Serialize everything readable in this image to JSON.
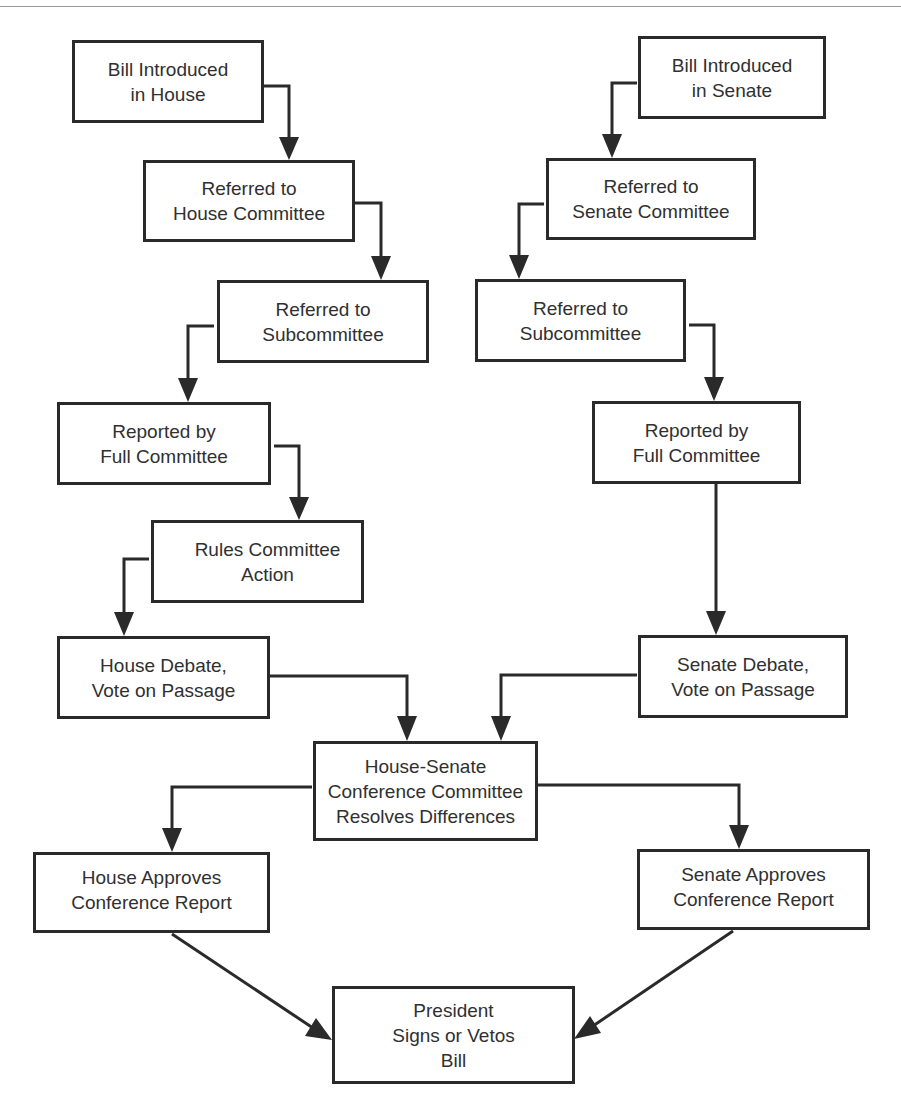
{
  "diagram": {
    "type": "flowchart",
    "colors": {
      "line": "#2a2a2a",
      "text": "#303030",
      "background": "#ffffff",
      "rule": "#9a9a9a"
    },
    "nodes": {
      "house_intro": {
        "label": "Bill Introduced\nin House"
      },
      "house_committee": {
        "label": "Referred to\nHouse Committee"
      },
      "house_subcomm": {
        "label": "Referred to\nSubcommittee"
      },
      "house_full": {
        "label": "Reported by\nFull Committee"
      },
      "house_rules": {
        "label": "Rules Committee\nAction"
      },
      "house_debate": {
        "label": "House Debate,\nVote on Passage"
      },
      "senate_intro": {
        "label": "Bill Introduced\nin Senate"
      },
      "senate_committee": {
        "label": "Referred to\nSenate Committee"
      },
      "senate_subcomm": {
        "label": "Referred to\nSubcommittee"
      },
      "senate_full": {
        "label": "Reported by\nFull Committee"
      },
      "senate_debate": {
        "label": "Senate Debate,\nVote on Passage"
      },
      "conference": {
        "label": "House-Senate\nConference Committee\nResolves Differences"
      },
      "house_approves": {
        "label": "House Approves\nConference Report"
      },
      "senate_approves": {
        "label": "Senate Approves\nConference Report"
      },
      "president": {
        "label": "President\nSigns or Vetos\nBill"
      }
    },
    "edges": [
      [
        "house_intro",
        "house_committee"
      ],
      [
        "house_committee",
        "house_subcomm"
      ],
      [
        "house_subcomm",
        "house_full"
      ],
      [
        "house_full",
        "house_rules"
      ],
      [
        "house_rules",
        "house_debate"
      ],
      [
        "house_debate",
        "conference"
      ],
      [
        "senate_intro",
        "senate_committee"
      ],
      [
        "senate_committee",
        "senate_subcomm"
      ],
      [
        "senate_subcomm",
        "senate_full"
      ],
      [
        "senate_full",
        "senate_debate"
      ],
      [
        "senate_debate",
        "conference"
      ],
      [
        "conference",
        "house_approves"
      ],
      [
        "conference",
        "senate_approves"
      ],
      [
        "house_approves",
        "president"
      ],
      [
        "senate_approves",
        "president"
      ]
    ]
  }
}
